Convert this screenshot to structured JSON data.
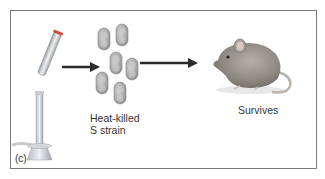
{
  "figure": {
    "panel_label": "(c)",
    "bacteria_label_line1": "Heat-killed",
    "bacteria_label_line2": "S strain",
    "outcome_label": "Survives",
    "elements": [
      "test-tube-over-burner",
      "arrow",
      "bacteria-cluster",
      "arrow",
      "mouse"
    ],
    "colors": {
      "frame": "#7a7a7a",
      "arrow": "#2a2a2a",
      "bacteria": "#9a9a9a",
      "text": "#333333"
    }
  }
}
